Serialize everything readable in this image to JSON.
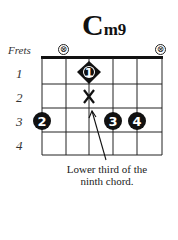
{
  "chord": {
    "root": "C",
    "quality": "m9"
  },
  "frets_label": "Frets",
  "fret_numbers": [
    "1",
    "2",
    "3",
    "4"
  ],
  "muted_strings": [
    1,
    6
  ],
  "mute_symbol": "⊗",
  "fingers": [
    {
      "finger": "1",
      "string": 3,
      "fret": 1,
      "shape": "diamond"
    },
    {
      "finger": "2",
      "string": 1,
      "fret": 3,
      "shape": "circle"
    },
    {
      "finger": "3",
      "string": 4,
      "fret": 3,
      "shape": "circle"
    },
    {
      "finger": "4",
      "string": 5,
      "fret": 3,
      "shape": "circle"
    }
  ],
  "x_marker": {
    "string": 3,
    "fret": 2,
    "symbol": "X"
  },
  "annotation": {
    "line1": "Lower third of the",
    "line2": "ninth chord."
  },
  "colors": {
    "ink": "#111111",
    "background": "#ffffff"
  }
}
